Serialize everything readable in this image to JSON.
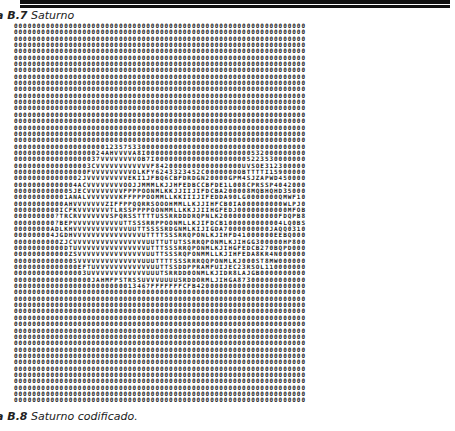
{
  "figure_top": {
    "label": "a B.7",
    "title": "Saturno"
  },
  "figure_bottom": {
    "label": "a B.8",
    "title": "Saturno codificado."
  },
  "grid": {
    "columns": 64,
    "rows": [
      "0000000000000000000000000000000000000000000000000000000000000000",
      "0000000000000000000000000000000000000000000000000000000000000000",
      "0000000000000000000000000000000000000000000000000000000000000000",
      "0000000000000000000000000000000000000000000000000000000000000000",
      "0000000000000000000000000000000000000000000000000000000000000000",
      "0000000000000000000000000000000000000000000000000000000000000000",
      "0000000000000000000000000000000000000000000000000000000000000000",
      "0000000000000000000000000000000000000000000000000000000000000000",
      "0000000000000000000000000000000000000000000000000000000000000000",
      "0000000000000000000000000000000000000000000000000000000000000000",
      "0000000000000000000000000000000000000000000000000000000000000000",
      "0000000000000000000000000000000000000000000000000000000000000000",
      "0000000000000000000000000000000000000000000000000000000000000000",
      "0000000000000000000000000000000000000000000000000000000000000000",
      "0000000000000000000000000000000000000000000000000000000000000000",
      "0000000000000000000000000000000000000000000000000000000000000000",
      "0000000000000000000000000000000000000000000000000000000000000000",
      "0000000000000000000000000000000000000000000000000000000000000000",
      "0000000000000000000000000000000000000000000000000000000000000000",
      "0000000000000000000012357533000000000000000000000000000000000000",
      "00000000000000000024AHVVVVA8I00000000000000000000000532000000000",
      "0000000000000000037VVVVVVVVOB7I00000000000000000000522353000000",
      "00000000000000003CVVVVVVVVVVVVF8420000000000000000UVSOE312300000",
      "0000000000000000FVVVVVVVVVOLKFY6243323452C0000000OBTTTTI1590000",
      "000000000000002JVVVVVVVVVEKI1JFBQ6CBFDRDGN20000GPM4SJZAPWD45000",
      "00000000000004ACVVVVVVVVOOJJMMMLKJJHFEDBCCBFDE1L008CPRSSP404200",
      "0000000000005JECVVVVVVVVFPPPOONMLKKJJIIJIFDCBA200008MQBHQHD3500",
      "000000000001ANALVVVVVVVKFFPPPOOMMLLKKIIIJIFEDDA90LG0000000QMWF1",
      "00000000000AHVVVVVVVZIFFPPQQRRSOOOHMMLLKJJIHFCB0IA000000000WLPJ0",
      "0000000000ICFKVVVVVVVTLRSSPPPPOONMMLLKKJJIIHGFEDJ00000000000MFOB",
      "000000000?TRCRVVVVVVVSPQRSSTTTTUSSRRDDDRQPNLK2000000000000FDQPB8",
      "000000000?BEPVVVVVVVVVVUTTSSSRRPPOONMLLKJIFDCB1000000000004LQ0BS",
      "00000000ADLKHVVVVVVVVVVVVUUTTSSSSRDGNMLKIJIGDA7000000000JAQQ031",
      "000000004JGDHVVVVVVVVVVVVVVVUTTTTSSSRRQPONLKJIHFD41000000EEBQ",
      "0000000000ZJCVVVVVVVVVVVVVVVVUUTTUTUTSSRRQPONMLKJIHGG300000HP8",
      "00000000000DTUVVVVVVVVVVVVVVVUTTTSSSRRQPONMLKJIHGFEDCB270BQPD",
      "000000000000ZSVVVVVVVVVVVVVVVUUTTSSSRQPONMMLLKJIHFEDA8KR4N00",
      "0000000000000SVVVVVVVVVVVVVVUUUTTTTSSSRRRQQPONMLKJ000ST8MW00",
      "00000000000000EFTUVVVVVVVVVVVVUUTTSSDDPPRAMFUIJEC23RSOL11000",
      "0000000000000003UVVVVVVVVVVVVUUUTSRRDD0ONMLKJIDR8LAJGB000000",
      "00000000000000000JAHMFPSTRSSUVVVUUUUSRDDORMLJIHGA8730000000",
      "000000000000000000000000013467FFFFFFFCFB420000000000000000000",
      "0000000000000000000000000000000000000000000000000000000000000000",
      "0000000000000000000000000000000000000000000000000000000000000000",
      "0000000000000000000000000000000000000000000000000000000000000000",
      "0000000000000000000000000000000000000000000000000000000000000000",
      "0000000000000000000000000000000000000000000000000000000000000000",
      "0000000000000000000000000000000000000000000000000000000000000000",
      "0000000000000000000000000000000000000000000000000000000000000000",
      "0000000000000000000000000000000000000000000000000000000000000000",
      "0000000000000000000000000000000000000000000000000000000000000000",
      "0000000000000000000000000000000000000000000000000000000000000000",
      "0000000000000000000000000000000000000000000000000000000000000000",
      "0000000000000000000000000000000000000000000000000000000000000000",
      "0000000000000000000000000000000000000000000000000000000000000000",
      "0000000000000000000000000000000000000000000000000000000000000000",
      "0000000000000000000000000000000000000000000000000000000000000000",
      "0000000000000000000000000000000000000000000000000000000000000000",
      "0000000000000000000000000000000000000000000000000000000000000000",
      "0000000000000000000000000000000000000000000000000000000000000000"
    ]
  }
}
